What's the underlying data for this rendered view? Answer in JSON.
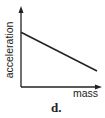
{
  "chart_data": {
    "type": "line",
    "title": "",
    "xlabel": "mass",
    "ylabel": "acceleration",
    "caption": "d.",
    "series": [
      {
        "name": "acceleration vs mass",
        "points": [
          {
            "x": 0,
            "y": 0.72
          },
          {
            "x": 1,
            "y": 0.21
          }
        ]
      }
    ],
    "xlim": [
      0,
      1
    ],
    "ylim": [
      0,
      1
    ],
    "grid": false,
    "legend": "none",
    "ticks": "none",
    "colors": {
      "axis": "#222222",
      "line": "#222222"
    }
  },
  "labels": {
    "xlabel": "mass",
    "ylabel": "acceleration",
    "caption": "d."
  }
}
